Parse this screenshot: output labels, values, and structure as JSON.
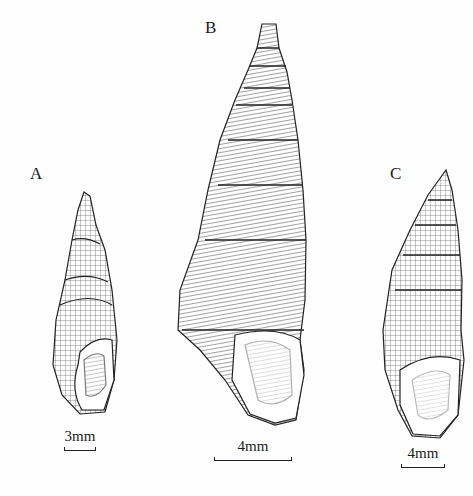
{
  "figure": {
    "panels": [
      {
        "id": "A",
        "label": "A",
        "scale_text": "3mm",
        "description": "Shell A: short turreted snail shell with reticulate sculpture and rounded aperture"
      },
      {
        "id": "B",
        "label": "B",
        "scale_text": "4mm",
        "description": "Shell B: tall elongated turreted shell with axial ribs and many whorls"
      },
      {
        "id": "C",
        "label": "C",
        "scale_text": "4mm",
        "description": "Shell C: slender fusiform shell with nodulose whorls"
      }
    ]
  }
}
